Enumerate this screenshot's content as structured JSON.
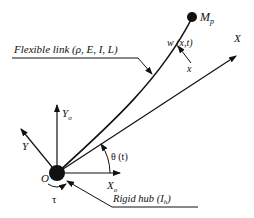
{
  "diagram": {
    "labels": {
      "flexible_link": "Flexible link (ρ, E, I, L)",
      "rigid_hub": "Rigid hub (I",
      "rigid_hub_sub": "h",
      "rigid_hub_close": ")",
      "payload": "M",
      "payload_sub": "p",
      "deflection": "w (x,t)",
      "position": "x",
      "axis_X": "X",
      "axis_Y": "Y",
      "axis_Xo": "X",
      "axis_Xo_sub": "o",
      "axis_Yo": "Y",
      "axis_Yo_sub": "o",
      "origin": "O",
      "torque": "τ",
      "angle": "θ (t)"
    },
    "colors": {
      "stroke": "#111111",
      "background": "#ffffff"
    }
  }
}
